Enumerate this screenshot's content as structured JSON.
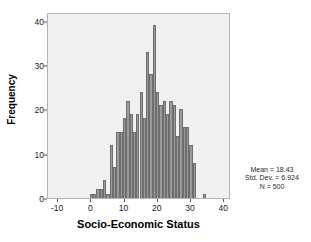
{
  "chart_data": {
    "type": "bar",
    "title": "",
    "xlabel": "Socio-Economic Status",
    "ylabel": "Frequency",
    "xlim": [
      -13,
      42
    ],
    "ylim": [
      0,
      42
    ],
    "xticks": [
      -10,
      0,
      10,
      20,
      30,
      40
    ],
    "xtick_labels": [
      "-10",
      "0",
      "10",
      "20",
      "30",
      "40"
    ],
    "yticks": [
      0,
      10,
      20,
      30,
      40
    ],
    "ytick_labels": [
      "0",
      "10",
      "20",
      "30",
      "40"
    ],
    "grid": false,
    "legend": null,
    "bin_width": 1,
    "bar_color": "#9b9b9b",
    "bar_edge_color": "#6e6e6e",
    "plot_background": "#f1f1f1",
    "x": [
      0,
      1,
      2,
      3,
      4,
      5,
      6,
      7,
      8,
      9,
      10,
      11,
      12,
      13,
      14,
      15,
      16,
      17,
      18,
      19,
      20,
      21,
      22,
      23,
      24,
      25,
      26,
      27,
      28,
      29,
      30,
      31,
      34
    ],
    "values": [
      1,
      1,
      2,
      2,
      4,
      1,
      12,
      7,
      15,
      15,
      18,
      22,
      19,
      15,
      19,
      24,
      18,
      33,
      28,
      39,
      24,
      21,
      22,
      19,
      22,
      21,
      14,
      20,
      16,
      16,
      12,
      8,
      1
    ],
    "annotations": [
      "Mean = 18.43",
      "Std. Dev. = 6.924",
      "N = 500"
    ]
  },
  "stats": {
    "mean_line": "Mean = 18.43",
    "stddev_line": "Std. Dev. = 6.924",
    "n_line": "N = 500"
  },
  "axes": {
    "y_title": "Frequency",
    "x_title": "Socio-Economic Status"
  }
}
